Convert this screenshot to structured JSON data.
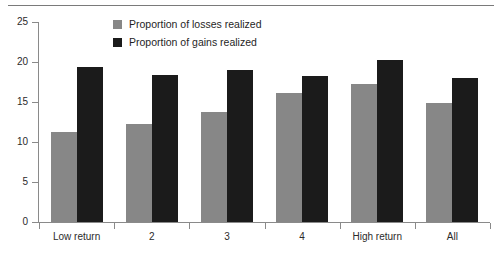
{
  "chart_data": {
    "type": "bar",
    "title": "",
    "subtitle": "",
    "xlabel": "",
    "ylabel": "",
    "categories": [
      "Low return",
      "2",
      "3",
      "4",
      "High return",
      "All"
    ],
    "series": [
      {
        "name": "Proportion of losses realized",
        "color": "#878787",
        "values": [
          11.3,
          12.3,
          13.8,
          16.1,
          17.2,
          14.9
        ]
      },
      {
        "name": "Proportion of gains realized",
        "color": "#1b1b1b",
        "values": [
          19.4,
          18.4,
          19.0,
          18.3,
          20.2,
          18.0
        ]
      }
    ],
    "ylim": [
      0,
      25
    ],
    "yticks": [
      0,
      5,
      10,
      15,
      20,
      25
    ],
    "ytick_labels": [
      "0",
      "5",
      "10",
      "15",
      "20",
      "25"
    ],
    "grid": false,
    "legend_position": "top-center"
  },
  "legend": {
    "entries": [
      {
        "label": "Proportion of losses realized",
        "swatch": "losses"
      },
      {
        "label": "Proportion of gains realized",
        "swatch": "gains"
      }
    ]
  }
}
